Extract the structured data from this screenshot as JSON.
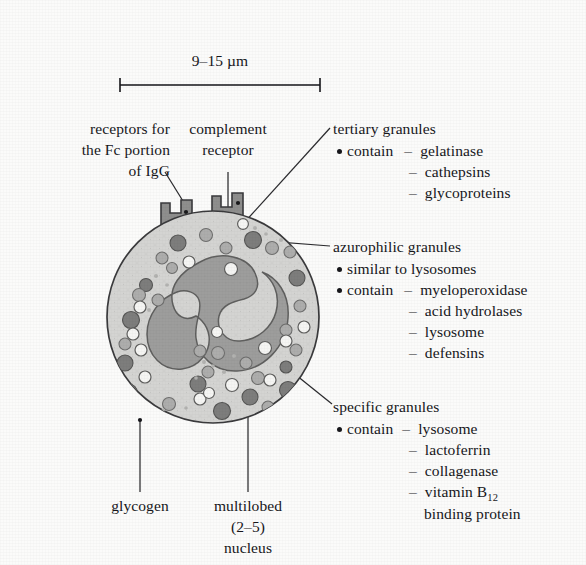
{
  "figure": {
    "scale_bar": {
      "label": "9–15 µm"
    },
    "colors": {
      "background": "#fbfbfa",
      "cytoplasm": "#d2d2d0",
      "nucleus": "#9a9a99",
      "granule_dark": "#7e7e7d",
      "granule_mid": "#a9a9a8",
      "granule_light": "#f4f4f2",
      "outline": "#3a3a3c",
      "text": "#16161a"
    }
  },
  "labels": {
    "fc_receptor": {
      "line1": "receptors for",
      "line2": "the Fc portion",
      "line3": "of IgG"
    },
    "complement_receptor": {
      "line1": "complement",
      "line2": "receptor"
    },
    "glycogen": {
      "line1": "glycogen"
    },
    "nucleus": {
      "line1": "multilobed",
      "line2": "(2–5)",
      "line3": "nucleus"
    }
  },
  "callouts": {
    "tertiary": {
      "title": "tertiary granules",
      "items": [
        {
          "bullet": true,
          "lead": "contain",
          "dash": "–",
          "text": "gelatinase"
        },
        {
          "bullet": false,
          "lead": "",
          "dash": "–",
          "text": "cathepsins"
        },
        {
          "bullet": false,
          "lead": "",
          "dash": "–",
          "text": "glycoproteins"
        }
      ]
    },
    "azurophilic": {
      "title": "azurophilic granules",
      "items": [
        {
          "bullet": true,
          "lead": "similar to lysosomes",
          "dash": "",
          "text": ""
        },
        {
          "bullet": true,
          "lead": "contain",
          "dash": "–",
          "text": "myeloperoxidase"
        },
        {
          "bullet": false,
          "lead": "",
          "dash": "–",
          "text": "acid hydrolases"
        },
        {
          "bullet": false,
          "lead": "",
          "dash": "–",
          "text": "lysosome"
        },
        {
          "bullet": false,
          "lead": "",
          "dash": "–",
          "text": "defensins"
        }
      ]
    },
    "specific": {
      "title": "specific granules",
      "items": [
        {
          "bullet": true,
          "lead": "contain",
          "dash": "–",
          "text": "lysosome"
        },
        {
          "bullet": false,
          "lead": "",
          "dash": "–",
          "text": "lactoferrin"
        },
        {
          "bullet": false,
          "lead": "",
          "dash": "–",
          "text": "collagenase"
        },
        {
          "bullet": false,
          "lead": "",
          "dash": "–",
          "text": "vitamin B"
        }
      ],
      "vitamin_subscript": "12",
      "vitamin_continuation": "binding protein"
    }
  }
}
